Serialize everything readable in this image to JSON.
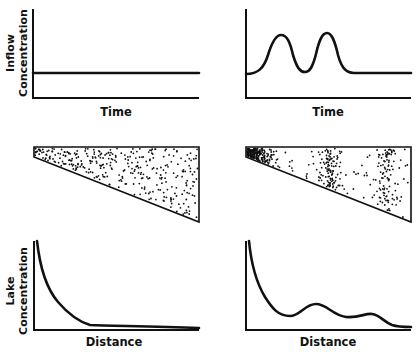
{
  "figure": {
    "rows": [
      {
        "name": "inflow",
        "ylabel_line1": "Inflow",
        "ylabel_line2": "Concentration",
        "panels": [
          {
            "position": "left",
            "xlabel": "Time",
            "description": "constant inflow concentration"
          },
          {
            "position": "right",
            "xlabel": "Time",
            "description": "two pulses of inflow concentration then constant"
          }
        ]
      },
      {
        "name": "lake-particles",
        "panels": [
          {
            "position": "left",
            "description": "wedge-shaped lake with particle density decreasing smoothly away from inflow"
          },
          {
            "position": "right",
            "description": "wedge-shaped lake with dense bands of particles at intervals"
          }
        ]
      },
      {
        "name": "lake-concentration",
        "ylabel_line1": "Lake",
        "ylabel_line2": "Concentration",
        "panels": [
          {
            "position": "left",
            "xlabel": "Distance",
            "description": "monotonic exponential-like decay"
          },
          {
            "position": "right",
            "xlabel": "Distance",
            "description": "decay with two secondary humps"
          }
        ]
      }
    ]
  },
  "colors": {
    "ink": "#111111",
    "background": "#ffffff"
  }
}
